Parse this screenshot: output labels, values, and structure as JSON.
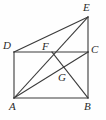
{
  "figure": {
    "type": "geometry-diagram",
    "background_color": "#fefefe",
    "stroke_color": "#3a3a3a",
    "label_color": "#2b2b2b",
    "width": 106,
    "height": 120,
    "points": [
      {
        "name": "A",
        "label": "A",
        "x": 14,
        "y": 98,
        "label_x": 9,
        "label_y": 101
      },
      {
        "name": "B",
        "label": "B",
        "x": 88,
        "y": 98,
        "label_x": 84,
        "label_y": 101
      },
      {
        "name": "C",
        "label": "C",
        "x": 88,
        "y": 52,
        "label_x": 91,
        "label_y": 44
      },
      {
        "name": "D",
        "label": "D",
        "x": 14,
        "y": 52,
        "label_x": 3,
        "label_y": 40
      },
      {
        "name": "E",
        "label": "E",
        "x": 88,
        "y": 17,
        "label_x": 83,
        "label_y": 2
      },
      {
        "name": "F",
        "label": "F",
        "x": 52,
        "y": 52,
        "label_x": 42,
        "label_y": 41
      },
      {
        "name": "G",
        "label": "G",
        "x": 62,
        "y": 76,
        "label_x": 58,
        "label_y": 72
      }
    ],
    "segments": [
      {
        "name": "side-AB",
        "from": "A",
        "to": "B"
      },
      {
        "name": "side-BC",
        "from": "B",
        "to": "C"
      },
      {
        "name": "side-CD",
        "from": "C",
        "to": "D"
      },
      {
        "name": "side-DA",
        "from": "D",
        "to": "A"
      },
      {
        "name": "segment-CE",
        "from": "C",
        "to": "E"
      },
      {
        "name": "segment-DE",
        "from": "D",
        "to": "E"
      },
      {
        "name": "segment-AE",
        "from": "A",
        "to": "E"
      },
      {
        "name": "segment-AC",
        "from": "A",
        "to": "C"
      },
      {
        "name": "segment-FB",
        "from": "F",
        "to": "B"
      }
    ]
  }
}
